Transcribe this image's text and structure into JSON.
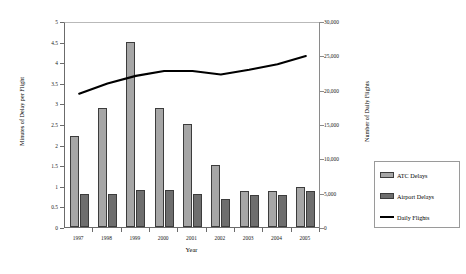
{
  "chart_data": {
    "type": "bar",
    "title": "",
    "subtitle": "",
    "xlabel": "Year",
    "ylabel": "Minutes of Delay per Flight",
    "y2label": "Number of Daily Flights",
    "categories": [
      "1997",
      "1998",
      "1999",
      "2000",
      "2001",
      "2002",
      "2003",
      "2004",
      "2005"
    ],
    "ylim": [
      0,
      5
    ],
    "y2lim": [
      0,
      30000
    ],
    "yticks": [
      "0",
      "0.5",
      "1",
      "1.5",
      "2",
      "2.5",
      "3",
      "3.5",
      "4",
      "4.5",
      "5"
    ],
    "ytick_values": [
      0,
      0.5,
      1,
      1.5,
      2,
      2.5,
      3,
      3.5,
      4,
      4.5,
      5
    ],
    "y2ticks": [
      "0",
      "5,000",
      "10,000",
      "15,000",
      "20,000",
      "25,000",
      "30,000"
    ],
    "y2tick_values": [
      0,
      5000,
      10000,
      15000,
      20000,
      25000,
      30000
    ],
    "grid": false,
    "legend_position": "bottom-right",
    "series": [
      {
        "name": "ATC Delays",
        "kind": "bar",
        "axis": "left",
        "color": "#a6a6a6",
        "values": [
          2.2,
          2.9,
          4.5,
          2.9,
          2.5,
          1.5,
          0.88,
          0.87,
          0.97
        ]
      },
      {
        "name": "Airport Delays",
        "kind": "bar",
        "axis": "left",
        "color": "#6e6e6e",
        "values": [
          0.8,
          0.8,
          0.9,
          0.9,
          0.8,
          0.68,
          0.78,
          0.78,
          0.87
        ]
      },
      {
        "name": "Daily Flights",
        "kind": "line",
        "axis": "right",
        "color": "#000000",
        "values": [
          19700,
          21200,
          22300,
          23000,
          23000,
          22500,
          23200,
          24000,
          25200
        ]
      }
    ]
  },
  "legend": {
    "items": [
      {
        "label": "ATC Delays",
        "swatch": "atc"
      },
      {
        "label": "Airport Delays",
        "swatch": "airport"
      },
      {
        "label": "Daily Flights",
        "swatch": "line"
      }
    ]
  }
}
